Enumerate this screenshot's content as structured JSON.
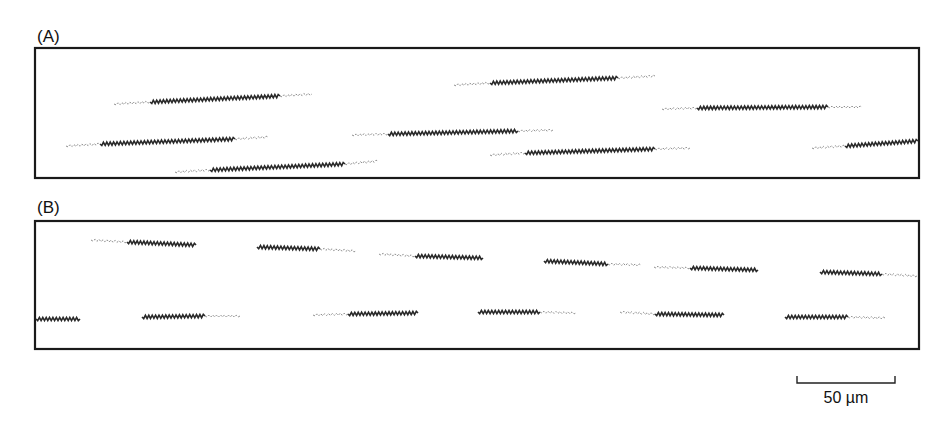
{
  "figure": {
    "panels": [
      {
        "id": "A",
        "label": "(A)",
        "filaments": [
          {
            "tail_start": [
              114,
              104
            ],
            "core_start": [
              150,
              102
            ],
            "core_end": [
              280,
              96
            ],
            "tail_end": [
              312,
              94
            ]
          },
          {
            "tail_start": [
              454,
              85
            ],
            "core_start": [
              490,
              83
            ],
            "core_end": [
              618,
              78
            ],
            "tail_end": [
              655,
              76
            ]
          },
          {
            "tail_start": [
              662,
              109
            ],
            "core_start": [
              697,
              108
            ],
            "core_end": [
              828,
              107
            ],
            "tail_end": [
              862,
              107
            ]
          },
          {
            "tail_start": [
              66,
              146
            ],
            "core_start": [
              100,
              144
            ],
            "core_end": [
              235,
              139
            ],
            "tail_end": [
              268,
              137
            ]
          },
          {
            "tail_start": [
              352,
              135
            ],
            "core_start": [
              388,
              134
            ],
            "core_end": [
              518,
              131
            ],
            "tail_end": [
              553,
              130
            ]
          },
          {
            "tail_start": [
              812,
              148
            ],
            "core_start": [
              845,
              146
            ],
            "core_end": [
              918,
              141
            ],
            "tail_end": null
          },
          {
            "tail_start": [
              490,
              155
            ],
            "core_start": [
              525,
              153
            ],
            "core_end": [
              655,
              149
            ],
            "tail_end": [
              690,
              148
            ]
          },
          {
            "tail_start": [
              175,
              172
            ],
            "core_start": [
              210,
              170
            ],
            "core_end": [
              345,
              164
            ],
            "tail_end": [
              378,
              161
            ]
          }
        ]
      },
      {
        "id": "B",
        "label": "(B)",
        "filaments": [
          {
            "tail_start": [
              91,
              240
            ],
            "core_start": [
              127,
              242
            ],
            "core_end": [
              196,
              245
            ],
            "tail_end": null
          },
          {
            "tail_start": null,
            "core_start": [
              257,
              247
            ],
            "core_end": [
              320,
              249
            ],
            "tail_end": [
              356,
              251
            ]
          },
          {
            "tail_start": [
              379,
              254
            ],
            "core_start": [
              415,
              256
            ],
            "core_end": [
              483,
              258
            ],
            "tail_end": null
          },
          {
            "tail_start": null,
            "core_start": [
              544,
              261
            ],
            "core_end": [
              608,
              264
            ],
            "tail_end": [
              641,
              265
            ]
          },
          {
            "tail_start": [
              654,
              267
            ],
            "core_start": [
              690,
              268
            ],
            "core_end": [
              758,
              270
            ],
            "tail_end": null
          },
          {
            "tail_start": null,
            "core_start": [
              820,
              272
            ],
            "core_end": [
              882,
              274
            ],
            "tail_end": [
              917,
              276
            ]
          },
          {
            "tail_start": null,
            "core_start": [
              36,
              319
            ],
            "core_end": [
              80,
              319
            ],
            "tail_end": null
          },
          {
            "tail_start": null,
            "core_start": [
              142,
              317
            ],
            "core_end": [
              205,
              316
            ],
            "tail_end": [
              240,
              316
            ]
          },
          {
            "tail_start": [
              313,
              315
            ],
            "core_start": [
              348,
              314
            ],
            "core_end": [
              418,
              313
            ],
            "tail_end": null
          },
          {
            "tail_start": null,
            "core_start": [
              478,
              312
            ],
            "core_end": [
              540,
              312
            ],
            "tail_end": [
              576,
              313
            ]
          },
          {
            "tail_start": [
              620,
              312
            ],
            "core_start": [
              655,
              314
            ],
            "core_end": [
              724,
              315
            ],
            "tail_end": null
          },
          {
            "tail_start": null,
            "core_start": [
              785,
              317
            ],
            "core_end": [
              848,
              317
            ],
            "tail_end": [
              885,
              318
            ]
          }
        ]
      }
    ],
    "scale_bar": {
      "label": "50 µm",
      "length_um": 50
    },
    "colors": {
      "frame": "#1a1a1a",
      "filament_core": "#2a2a2a",
      "filament_tail": "#8f8f8f"
    }
  }
}
